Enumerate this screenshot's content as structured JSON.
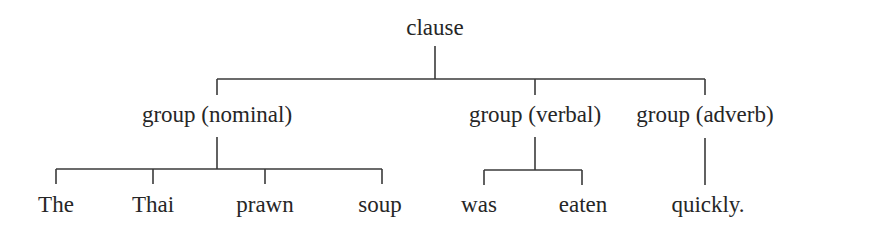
{
  "diagram": {
    "type": "constituency-tree",
    "colors": {
      "text": "#262626",
      "lines": "#3a3a3a",
      "background": "#ffffff"
    },
    "root": {
      "label": "clause"
    },
    "groups": [
      {
        "label": "group (nominal)",
        "words": [
          "The",
          "Thai",
          "prawn",
          "soup"
        ]
      },
      {
        "label": "group (verbal)",
        "words": [
          "was",
          "eaten"
        ]
      },
      {
        "label": "group (adverb)",
        "words": [
          "quickly."
        ]
      }
    ]
  }
}
